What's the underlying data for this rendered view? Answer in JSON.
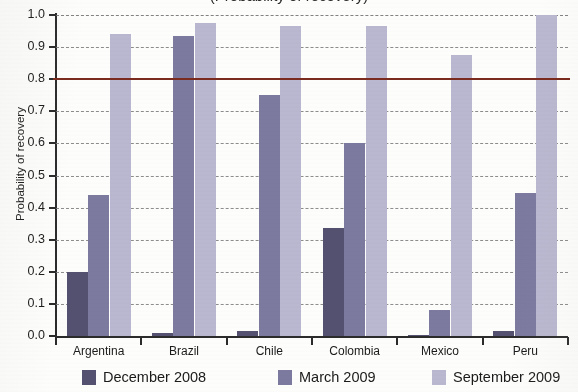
{
  "figure": {
    "title_cropped_remnant": "(Probability of recovery)",
    "background_color": "#fdfdfc"
  },
  "chart_data": {
    "type": "bar",
    "title": "",
    "xlabel": "",
    "ylabel": "Probability of recovery",
    "categories": [
      "Argentina",
      "Brazil",
      "Chile",
      "Colombia",
      "Mexico",
      "Peru"
    ],
    "series": [
      {
        "name": "December 2008",
        "color": "#545070",
        "values": [
          0.2,
          0.008,
          0.015,
          0.335,
          0.003,
          0.015
        ]
      },
      {
        "name": "March 2009",
        "color": "#7d7aa0",
        "values": [
          0.44,
          0.935,
          0.75,
          0.6,
          0.08,
          0.445
        ]
      },
      {
        "name": "September 2009",
        "color": "#b9b8d0",
        "values": [
          0.94,
          0.975,
          0.965,
          0.965,
          0.875,
          1.0
        ]
      }
    ],
    "ylim": [
      0.0,
      1.0
    ],
    "yticks": [
      "0.0",
      "0.1",
      "0.2",
      "0.3",
      "0.4",
      "0.5",
      "0.6",
      "0.7",
      "0.8",
      "0.9",
      "1.0"
    ],
    "ytick_values": [
      0.0,
      0.1,
      0.2,
      0.3,
      0.4,
      0.5,
      0.6,
      0.7,
      0.8,
      0.9,
      1.0
    ],
    "grid": true,
    "grid_style": "dashed",
    "threshold_line": {
      "value": 0.8,
      "color": "#7b2b1e"
    },
    "legend_position": "bottom"
  }
}
